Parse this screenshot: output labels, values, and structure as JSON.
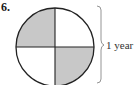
{
  "problem": {
    "number": "6.",
    "label": "1 year"
  },
  "diagram": {
    "shape": "circle",
    "parts": 4,
    "shaded_parts": [
      "top-left",
      "bottom-right"
    ],
    "shade_color": "#c8c8c8",
    "line_color": "#222222"
  }
}
